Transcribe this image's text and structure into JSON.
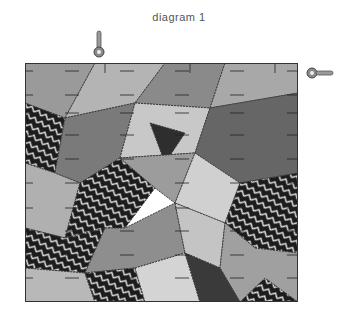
{
  "title": "diagram 1",
  "quilt": {
    "style": "grayscale crazy quilt patchwork",
    "pieces": [
      {
        "points": "0,0 70,0 40,55 0,40",
        "fill": "#9a9a9a"
      },
      {
        "points": "70,0 140,0 110,40 40,55",
        "fill": "#b4b4b4"
      },
      {
        "points": "140,0 200,0 185,45 110,40",
        "fill": "#8a8a8a"
      },
      {
        "points": "200,0 273,0 273,30 185,45",
        "fill": "#a8a8a8"
      },
      {
        "points": "0,40 40,55 30,110 0,100",
        "fill": "#3a3a3a",
        "pattern": "chevron"
      },
      {
        "points": "40,55 110,40 95,95 55,120 30,110",
        "fill": "#7a7a7a"
      },
      {
        "points": "110,40 185,45 170,90 95,95",
        "fill": "#c8c8c8"
      },
      {
        "points": "185,45 273,30 273,110 215,120 170,90",
        "fill": "#666666"
      },
      {
        "points": "125,60 160,70 140,100",
        "fill": "#2e2e2e"
      },
      {
        "points": "0,100 30,110 55,120 40,175 0,165",
        "fill": "#b0b0b0"
      },
      {
        "points": "55,120 95,95 130,125 100,165 40,175",
        "fill": "#2a2a2a",
        "pattern": "chevron"
      },
      {
        "points": "95,95 170,90 150,140 130,125",
        "fill": "#9c9c9c"
      },
      {
        "points": "170,90 215,120 200,160 150,140",
        "fill": "#d0d0d0"
      },
      {
        "points": "215,120 273,110 273,190 230,185 200,160",
        "fill": "#2c2c2c",
        "pattern": "chevron"
      },
      {
        "points": "0,165 40,175 80,165 60,210 0,205",
        "fill": "#2e2e2e",
        "pattern": "chevron"
      },
      {
        "points": "80,165 100,165 150,140 160,190 110,205 60,210",
        "fill": "#8e8e8e"
      },
      {
        "points": "150,140 200,160 195,205 160,190",
        "fill": "#c4c4c4"
      },
      {
        "points": "200,160 230,185 273,190 273,239 215,239 195,205",
        "fill": "#a0a0a0"
      },
      {
        "points": "0,205 60,210 70,239 0,239",
        "fill": "#b8b8b8"
      },
      {
        "points": "60,210 110,205 120,239 70,239",
        "fill": "#222222",
        "pattern": "chevron"
      },
      {
        "points": "110,205 160,190 175,239 120,239",
        "fill": "#d4d4d4"
      },
      {
        "points": "160,190 195,205 215,239 175,239",
        "fill": "#3a3a3a"
      },
      {
        "points": "215,239 240,215 273,239",
        "fill": "#262626",
        "pattern": "chevron"
      }
    ],
    "tick_rows_y": [
      8,
      32,
      50,
      72,
      96,
      120,
      145,
      168,
      192,
      215
    ],
    "tick_cols_x": [
      80,
      165,
      250
    ]
  },
  "pins": {
    "top": "vertical-pin-icon",
    "right": "horizontal-pin-icon"
  }
}
